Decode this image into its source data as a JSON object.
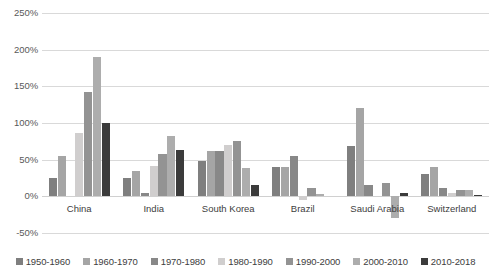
{
  "chart_data": {
    "type": "bar",
    "title": "",
    "subtitle": "",
    "xlabel": "",
    "ylabel": "",
    "ylim": [
      -50,
      250
    ],
    "ytick_labels": [
      "250%",
      "200%",
      "150%",
      "100%",
      "50%",
      "0%",
      "-50%"
    ],
    "ytick_values": [
      250,
      200,
      150,
      100,
      50,
      0,
      -50
    ],
    "grid": true,
    "grid_axis": "y",
    "value_unit": "%",
    "legend_position": "bottom",
    "categories": [
      "China",
      "India",
      "South Korea",
      "Brazil",
      "Saudi Arabia",
      "Switzerland"
    ],
    "series": [
      {
        "name": "1950-1960",
        "color": "#7f7f7f",
        "values": [
          25,
          25,
          48,
          40,
          68,
          30
        ]
      },
      {
        "name": "1960-1970",
        "color": "#a5a5a5",
        "values": [
          55,
          35,
          62,
          40,
          120,
          40
        ]
      },
      {
        "name": "1970-1980",
        "color": "#888888",
        "values": [
          null,
          5,
          62,
          55,
          15,
          12
        ]
      },
      {
        "name": "1980-1990",
        "color": "#d0cece",
        "values": [
          87,
          42,
          70,
          -5,
          null,
          5
        ]
      },
      {
        "name": "1990-2000",
        "color": "#939393",
        "values": [
          142,
          58,
          75,
          12,
          18,
          8
        ]
      },
      {
        "name": "2000-2010",
        "color": "#adadad",
        "values": [
          190,
          82,
          38,
          3,
          -30,
          8
        ]
      },
      {
        "name": "2010-2018",
        "color": "#3b3b3b",
        "values": [
          100,
          63,
          15,
          null,
          5,
          2
        ]
      }
    ]
  },
  "legend": {
    "items": [
      {
        "label": "1950-1960",
        "color": "#7f7f7f"
      },
      {
        "label": "1960-1970",
        "color": "#a5a5a5"
      },
      {
        "label": "1970-1980",
        "color": "#888888"
      },
      {
        "label": "1980-1990",
        "color": "#d0cece"
      },
      {
        "label": "1990-2000",
        "color": "#939393"
      },
      {
        "label": "2000-2010",
        "color": "#adadad"
      },
      {
        "label": "2010-2018",
        "color": "#3b3b3b"
      }
    ]
  },
  "style": {
    "gridline_color": "#d9d9d9",
    "text_color": "#404040",
    "tick_color": "#595959",
    "background": "#ffffff"
  }
}
